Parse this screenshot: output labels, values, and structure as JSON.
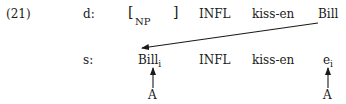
{
  "example": {
    "number": "(21)"
  },
  "d_row": {
    "label": "d:",
    "np_open": "[",
    "np_label": "NP",
    "np_close": "]",
    "infl": "INFL",
    "verb": "kiss-en",
    "object": "Bill"
  },
  "s_row": {
    "label": "s:",
    "subject": "Bill",
    "subject_index": "i",
    "infl": "INFL",
    "verb": "kiss-en",
    "trace": "e",
    "trace_index": "i"
  },
  "annotations": {
    "subject_marker": "A",
    "trace_marker": "A"
  },
  "movement": {
    "from": "d_row.object",
    "to": "s_row.subject"
  }
}
